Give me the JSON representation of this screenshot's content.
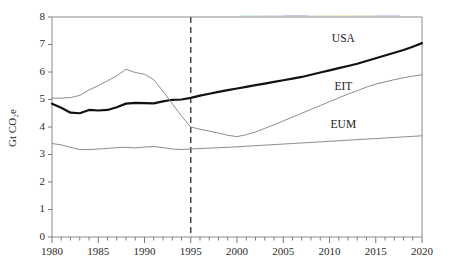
{
  "chart_data": {
    "type": "line",
    "title": "",
    "xlabel": "",
    "ylabel": "Gt CO2e",
    "ylabel_display": "Gt CO₂e",
    "xlim": [
      1980,
      2020
    ],
    "ylim": [
      0,
      8
    ],
    "grid": false,
    "legend_position": "inline-right-of-lines",
    "x_tick_labels": [
      "1980",
      "1985",
      "1990",
      "1995",
      "2000",
      "2005",
      "2010",
      "2015",
      "2020"
    ],
    "x_tick_values": [
      1980,
      1985,
      1990,
      1995,
      2000,
      2005,
      2010,
      2015,
      2020
    ],
    "x_minor_tick_step": 1,
    "y_tick_labels": [
      "0",
      "1",
      "2",
      "3",
      "4",
      "5",
      "6",
      "7",
      "8"
    ],
    "y_tick_values": [
      0,
      1,
      2,
      3,
      4,
      5,
      6,
      7,
      8
    ],
    "annotations": [
      {
        "name": "history-projection-divider",
        "type": "vline",
        "x": 1995,
        "style": "dashed"
      }
    ],
    "x": [
      1980,
      1981,
      1982,
      1983,
      1984,
      1985,
      1986,
      1987,
      1988,
      1989,
      1990,
      1991,
      1992,
      1993,
      1994,
      1995,
      1996,
      1997,
      1998,
      1999,
      2000,
      2001,
      2002,
      2003,
      2004,
      2005,
      2006,
      2007,
      2008,
      2009,
      2010,
      2011,
      2012,
      2013,
      2014,
      2015,
      2016,
      2017,
      2018,
      2019,
      2020
    ],
    "series": [
      {
        "name": "USA",
        "label": "USA",
        "color": "#111111",
        "width": "thick",
        "values": [
          4.85,
          4.7,
          4.52,
          4.5,
          4.62,
          4.6,
          4.62,
          4.72,
          4.85,
          4.88,
          4.87,
          4.86,
          4.93,
          4.99,
          5.0,
          5.06,
          5.14,
          5.21,
          5.28,
          5.34,
          5.4,
          5.46,
          5.52,
          5.58,
          5.64,
          5.7,
          5.76,
          5.82,
          5.9,
          5.98,
          6.06,
          6.14,
          6.22,
          6.3,
          6.4,
          6.5,
          6.6,
          6.7,
          6.8,
          6.92,
          7.05
        ]
      },
      {
        "name": "EIT",
        "label": "EIT",
        "color": "#8c8c8c",
        "width": "thin",
        "values": [
          5.05,
          5.05,
          5.07,
          5.15,
          5.35,
          5.5,
          5.68,
          5.86,
          6.1,
          5.98,
          5.92,
          5.72,
          5.3,
          4.85,
          4.4,
          4.0,
          3.92,
          3.85,
          3.78,
          3.7,
          3.65,
          3.72,
          3.82,
          3.95,
          4.08,
          4.22,
          4.36,
          4.5,
          4.64,
          4.78,
          4.92,
          5.06,
          5.2,
          5.32,
          5.45,
          5.56,
          5.64,
          5.72,
          5.79,
          5.85,
          5.9
        ]
      },
      {
        "name": "EUM",
        "label": "EUM",
        "color": "#8c8c8c",
        "width": "thin",
        "values": [
          3.4,
          3.35,
          3.26,
          3.18,
          3.18,
          3.2,
          3.22,
          3.25,
          3.26,
          3.24,
          3.27,
          3.29,
          3.25,
          3.2,
          3.18,
          3.2,
          3.22,
          3.23,
          3.25,
          3.26,
          3.28,
          3.3,
          3.32,
          3.34,
          3.36,
          3.38,
          3.4,
          3.42,
          3.44,
          3.46,
          3.48,
          3.5,
          3.52,
          3.54,
          3.56,
          3.58,
          3.6,
          3.62,
          3.64,
          3.66,
          3.68
        ]
      }
    ],
    "series_label_positions": [
      {
        "name": "USA",
        "x": 2011.5,
        "y": 7.1
      },
      {
        "name": "EIT",
        "x": 2011.5,
        "y": 5.35
      },
      {
        "name": "EUM",
        "x": 2011.5,
        "y": 3.95
      }
    ]
  }
}
